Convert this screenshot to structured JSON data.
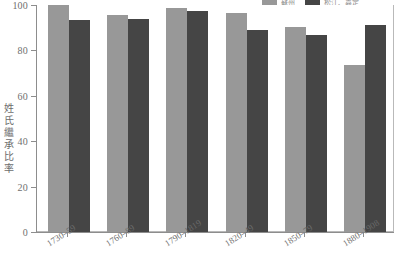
{
  "chart_data": {
    "type": "bar",
    "title": "",
    "subtitle": "",
    "xlabel": "",
    "ylabel": "姓氏繼承比率",
    "ylim": [
      0,
      100
    ],
    "yticks": [
      0,
      20,
      40,
      60,
      80,
      100
    ],
    "ytick_labels": [
      "0",
      "20",
      "40",
      "60",
      "80",
      "100"
    ],
    "grid": false,
    "legend_position": "top-right",
    "categories": [
      "1730–59",
      "1760–89",
      "1790–1819",
      "1820–49",
      "1850–79",
      "1880–1908"
    ],
    "series": [
      {
        "name": "蘇州",
        "color": "#989898",
        "values": [
          100,
          95.5,
          98.5,
          96.5,
          90.5,
          73.5
        ]
      },
      {
        "name": "松江、嘉定",
        "color": "#454545",
        "values": [
          93.5,
          94,
          97.5,
          89,
          87,
          91
        ]
      }
    ]
  },
  "legend": {
    "items": [
      {
        "label": "蘇州",
        "color": "#989898"
      },
      {
        "label": "松江、嘉定",
        "color": "#454545"
      }
    ]
  },
  "axes": {
    "frame_color": "#b9b9b9",
    "axis_color": "#8d8d8d",
    "tick_text_color": "#6f6f6f"
  }
}
